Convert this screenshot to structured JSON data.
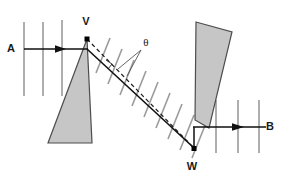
{
  "figure": {
    "background_color": "#ffffff",
    "width": 286,
    "height": 176
  },
  "colors": {
    "prism_fill": "#c6c6c6",
    "prism_stroke": "#4d4d4d",
    "ray_stroke": "#111111",
    "wavefront_stroke": "#9a9a9a",
    "dashed_stroke": "#1a1a1a",
    "leader_stroke": "#555555",
    "label_color": "#1a1a1a",
    "vertex_dot_color": "#000000"
  },
  "labels": {
    "ray_in": "A",
    "ray_out": "B",
    "vertex_top": "V",
    "vertex_bottom": "W",
    "angle": "θ"
  },
  "label_positions": {
    "ray_in": {
      "x": 11,
      "y": 52
    },
    "ray_out": {
      "x": 270,
      "y": 129
    },
    "vertex_top": {
      "x": 84,
      "y": 24
    },
    "vertex_bottom": {
      "x": 190,
      "y": 169
    },
    "angle": {
      "x": 143,
      "y": 43
    }
  },
  "prisms": [
    {
      "name": "left-prism",
      "points": "87,39 92,143 48,143"
    },
    {
      "name": "right-prism",
      "points": "196,22 232,32 209,128 195,120"
    }
  ],
  "vertices": [
    {
      "name": "V",
      "x": 87,
      "y": 39
    },
    {
      "name": "W",
      "x": 194,
      "y": 149
    }
  ],
  "rays": {
    "incident": {
      "name": "incident-ray-a",
      "x1": 24,
      "y1": 49,
      "x2": 87,
      "y2": 49,
      "arrow_at": {
        "x": 62,
        "y": 49
      }
    },
    "internal": {
      "name": "refracted-ray-internal",
      "points": "87,49 194,148"
    },
    "emergent": {
      "name": "emergent-ray-b",
      "x1": 194,
      "y1": 127,
      "x2": 266,
      "y2": 127,
      "arrow_at": {
        "x": 240,
        "y": 127
      }
    },
    "link_vw": {
      "name": "ray-segment-to-w",
      "x1": 194,
      "y1": 148,
      "x2": 194,
      "y2": 127
    }
  },
  "construction_line": {
    "name": "dashed-normal-line",
    "x1": 87,
    "y1": 39,
    "x2": 194,
    "y2": 148,
    "dash": "4,3"
  },
  "angle_marker": {
    "name": "angle-arc-theta",
    "apex": {
      "x": 114,
      "y": 66
    },
    "leaders": [
      {
        "x1": 141,
        "y1": 48,
        "x2": 118,
        "y2": 69
      },
      {
        "x1": 141,
        "y1": 48,
        "x2": 126,
        "y2": 75
      }
    ]
  },
  "wavefronts": {
    "left_group": {
      "name": "wavefronts-incident",
      "orientation": "vertical",
      "lines": [
        {
          "x1": 24,
          "y1": 22,
          "x2": 24,
          "y2": 96
        },
        {
          "x1": 43,
          "y1": 22,
          "x2": 43,
          "y2": 96
        },
        {
          "x1": 62,
          "y1": 20,
          "x2": 62,
          "y2": 96
        }
      ]
    },
    "middle_group": {
      "name": "wavefronts-internal",
      "orientation": "tilted",
      "lines": [
        {
          "x1": 96,
          "y1": 73,
          "x2": 110,
          "y2": 38
        },
        {
          "x1": 108,
          "y1": 84,
          "x2": 122,
          "y2": 49
        },
        {
          "x1": 120,
          "y1": 95,
          "x2": 134,
          "y2": 60
        },
        {
          "x1": 132,
          "y1": 106,
          "x2": 146,
          "y2": 71
        },
        {
          "x1": 144,
          "y1": 117,
          "x2": 158,
          "y2": 82
        },
        {
          "x1": 156,
          "y1": 128,
          "x2": 170,
          "y2": 93
        },
        {
          "x1": 168,
          "y1": 139,
          "x2": 182,
          "y2": 104
        },
        {
          "x1": 180,
          "y1": 150,
          "x2": 194,
          "y2": 115
        },
        {
          "x1": 192,
          "y1": 158,
          "x2": 206,
          "y2": 123
        }
      ]
    },
    "right_group": {
      "name": "wavefronts-emergent",
      "orientation": "vertical",
      "lines": [
        {
          "x1": 216,
          "y1": 100,
          "x2": 216,
          "y2": 153
        },
        {
          "x1": 238,
          "y1": 100,
          "x2": 238,
          "y2": 153
        },
        {
          "x1": 259,
          "y1": 100,
          "x2": 259,
          "y2": 153
        }
      ]
    }
  }
}
